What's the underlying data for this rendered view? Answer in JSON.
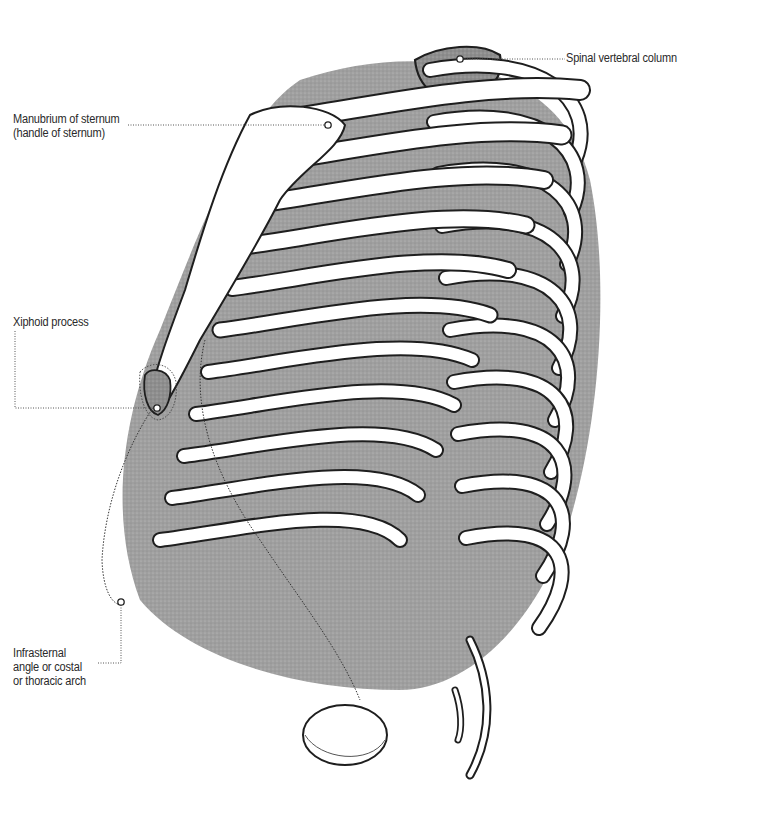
{
  "figure": {
    "colors": {
      "outline": "#1e1e1e",
      "shade": "#8a8a8a",
      "bone": "#ffffff",
      "leader": "#555555"
    }
  },
  "labels": {
    "manubrium": {
      "lines": [
        "Manubrium of sternum",
        "(handle of sternum)"
      ]
    },
    "spinal": {
      "lines": [
        "Spinal vertebral column"
      ]
    },
    "xiphoid": {
      "lines": [
        "Xiphoid process"
      ]
    },
    "infrasternal": {
      "lines": [
        "Infrasternal",
        "angle or costal",
        "or thoracic arch"
      ]
    }
  }
}
